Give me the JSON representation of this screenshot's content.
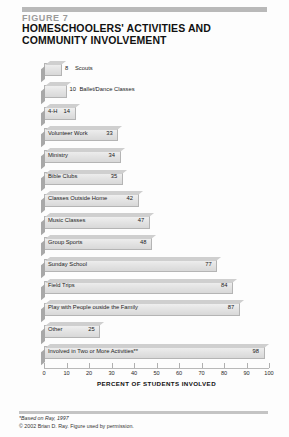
{
  "figure": {
    "number_label": "FIGURE 7",
    "title": "HOMESCHOOLERS' ACTIVITIES AND COMMUNITY INVOLVEMENT",
    "y_axis_title": "HOME SCHOOL STUDENTS' ACTIVITIES, GRADES K-12",
    "x_axis_title": "PERCENT OF STUDENTS INVOLVED",
    "footnote_source": "*Based on Ray, 1997",
    "footnote_copyright": "© 2002 Brian D. Ray. Figure used by permission."
  },
  "colors": {
    "bar_face": "#e4e4e4",
    "bar_top": "#cfcfcf",
    "bar_side": "#a8a8a8",
    "bar_outline": "#b4b4b4",
    "rule": "#b9b9b9",
    "fig_num": "#9a9a9a",
    "text": "#1b1b1b"
  },
  "chart_data": {
    "type": "bar",
    "orientation": "horizontal",
    "title": "HOMESCHOOLERS' ACTIVITIES AND COMMUNITY INVOLVEMENT",
    "xlabel": "PERCENT OF STUDENTS INVOLVED",
    "ylabel": "HOME SCHOOL STUDENTS' ACTIVITIES, GRADES K-12",
    "xlim": [
      0,
      100
    ],
    "xticks": [
      0,
      10,
      20,
      30,
      40,
      50,
      60,
      70,
      80,
      90,
      100
    ],
    "xtick_labels": [
      "0",
      "10",
      "20",
      "30",
      "40",
      "50",
      "60",
      "70",
      "80",
      "90",
      "100"
    ],
    "grid": false,
    "legend": false,
    "categories": [
      "Scouts",
      "Ballet/Dance Classes",
      "4-H",
      "Volunteer Work",
      "Ministry",
      "Bible Clubs",
      "Classes Outside Home",
      "Music Classes",
      "Group Sports",
      "Sunday School",
      "Field Trips",
      "Play with People ouside the Family",
      "Other",
      "Involved in Two or More Activities**"
    ],
    "values": [
      8,
      10,
      14,
      33,
      34,
      35,
      42,
      47,
      48,
      77,
      84,
      87,
      25,
      98
    ],
    "bars": [
      {
        "label": "Scouts",
        "value": 8,
        "value_text": "8",
        "label_position": "outside"
      },
      {
        "label": "Ballet/Dance Classes",
        "value": 10,
        "value_text": "10",
        "label_position": "outside"
      },
      {
        "label": "4-H",
        "value": 14,
        "value_text": "14",
        "label_position": "inside"
      },
      {
        "label": "Volunteer Work",
        "value": 33,
        "value_text": "33",
        "label_position": "inside"
      },
      {
        "label": "Ministry",
        "value": 34,
        "value_text": "34",
        "label_position": "inside"
      },
      {
        "label": "Bible Clubs",
        "value": 35,
        "value_text": "35",
        "label_position": "inside"
      },
      {
        "label": "Classes Outside Home",
        "value": 42,
        "value_text": "42",
        "label_position": "inside"
      },
      {
        "label": "Music Classes",
        "value": 47,
        "value_text": "47",
        "label_position": "inside"
      },
      {
        "label": "Group Sports",
        "value": 48,
        "value_text": "48",
        "label_position": "inside"
      },
      {
        "label": "Sunday School",
        "value": 77,
        "value_text": "77",
        "label_position": "inside"
      },
      {
        "label": "Field Trips",
        "value": 84,
        "value_text": "84",
        "label_position": "inside"
      },
      {
        "label": "Play with People ouside the Family",
        "value": 87,
        "value_text": "87",
        "label_position": "inside"
      },
      {
        "label": "Other",
        "value": 25,
        "value_text": "25",
        "label_position": "inside"
      },
      {
        "label": "Involved in Two or More Activities**",
        "value": 98,
        "value_text": "98",
        "label_position": "inside"
      }
    ]
  }
}
